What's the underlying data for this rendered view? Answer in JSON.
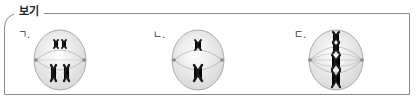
{
  "box": {
    "title": "보기"
  },
  "items": [
    {
      "label": "ㄱ.",
      "stage": "homologous pairs separating toward poles (two tetrad-like groups)"
    },
    {
      "label": "ㄴ.",
      "stage": "single replicated chromosomes at upper and lower positions"
    },
    {
      "label": "ㄷ.",
      "stage": "chromosomes aligned on metaphase plate"
    }
  ],
  "colors": {
    "border": "#8a8a8a",
    "cell_fill": "#f2f2f2",
    "cell_stroke": "#9a9a9a",
    "spindle": "#a8a8a8",
    "chromosome": "#1a1a1a"
  }
}
